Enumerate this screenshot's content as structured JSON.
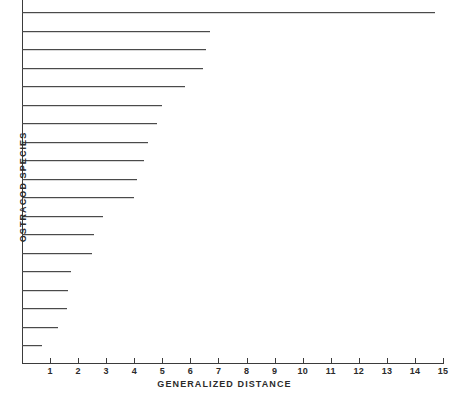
{
  "chart_data": {
    "type": "bar",
    "orientation": "horizontal",
    "title": "",
    "xlabel": "GENERALIZED  DISTANCE",
    "ylabel": "OSTRACOD  SPECIES",
    "xlim": [
      0,
      15
    ],
    "ylim": [
      0,
      20
    ],
    "grid": false,
    "legend": null,
    "xticks": [
      1,
      2,
      3,
      4,
      5,
      6,
      7,
      8,
      9,
      10,
      11,
      12,
      13,
      14,
      15
    ],
    "xtick_labels": [
      "1",
      "2",
      "3",
      "4",
      "5",
      "6",
      "7",
      "8",
      "9",
      "10",
      "11",
      "12",
      "13",
      "14",
      "15"
    ],
    "yticks": [],
    "ytick_labels": [],
    "categories": [
      "species-1",
      "species-2",
      "species-3",
      "species-4",
      "species-5",
      "species-6",
      "species-7",
      "species-8",
      "species-9",
      "species-10",
      "species-11",
      "species-12",
      "species-13",
      "species-14",
      "species-15",
      "species-16",
      "species-17",
      "species-18",
      "species-19"
    ],
    "values": [
      14.7,
      6.7,
      6.55,
      6.45,
      5.8,
      5.0,
      4.8,
      4.5,
      4.35,
      4.1,
      4.0,
      2.9,
      2.55,
      2.5,
      1.75,
      1.65,
      1.6,
      1.3,
      0.7
    ],
    "bar_color": "#4a4a4a",
    "axis_color": "#3b3b3b",
    "background_color": "#ffffff"
  },
  "axes": {
    "x_title": "GENERALIZED  DISTANCE",
    "y_title": "OSTRACOD  SPECIES"
  }
}
